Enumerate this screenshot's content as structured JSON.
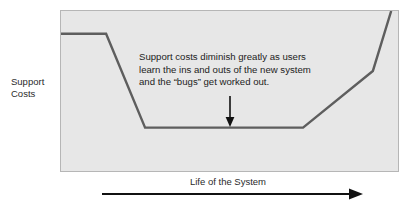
{
  "figure": {
    "name": "support-costs-over-system-life-diagram",
    "background_color": "#ffffff"
  },
  "axes": {
    "y_label": "Support\nCosts",
    "x_label": "Life of the System",
    "x_arrow_icon": "arrow-right-icon",
    "plot_background_color": "#e7e7e7",
    "plot_border_color": "#b6b6b6"
  },
  "annotation": {
    "text": "Support costs diminish greatly as users\nlearn the ins and outs of the new system\nand the “bugs” get worked out.",
    "pointer_icon": "arrow-down-icon",
    "pointer_color": "#111111"
  },
  "chart_data": {
    "type": "line",
    "title": "",
    "subtitle": "",
    "xlabel": "Life of the System",
    "ylabel": "Support Costs",
    "grid": false,
    "legend": null,
    "line_color": "#5e5e5e",
    "line_width": 2.4,
    "xlim": [
      0,
      100
    ],
    "ylim": [
      0,
      100
    ],
    "axis_tick_labels": {
      "x": [],
      "y": []
    },
    "series": [
      {
        "name": "Support costs",
        "x": [
          0,
          13.3,
          24.8,
          71.4,
          92.0,
          97.4
        ],
        "y": [
          86.0,
          86.0,
          28.0,
          28.0,
          63.0,
          100.0
        ]
      }
    ],
    "annotations": [
      {
        "text": "Support costs diminish greatly as users learn the ins and outs of the new system and the “bugs” get worked out.",
        "x": 51.3,
        "y": 70.0,
        "arrow_to": {
          "x": 51.3,
          "y": 30.0
        },
        "arrow_direction": "down"
      }
    ]
  }
}
